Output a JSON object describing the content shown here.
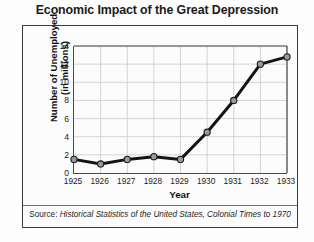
{
  "chart_data": {
    "type": "line",
    "title": "Economic Impact of the Great Depression",
    "xlabel": "Year",
    "ylabel": "Number of Unemployed\n(in millions)",
    "ylabel_line1": "Number of Unemployed",
    "ylabel_line2": "(in millions)",
    "categories": [
      "1925",
      "1926",
      "1927",
      "1928",
      "1929",
      "1930",
      "1931",
      "1932",
      "1933"
    ],
    "values": [
      1.5,
      1.0,
      1.5,
      1.8,
      1.5,
      4.5,
      8.0,
      12.0,
      12.8
    ],
    "x": [
      1925,
      1926,
      1927,
      1928,
      1929,
      1930,
      1931,
      1932,
      1933
    ],
    "xlim": [
      1925,
      1933
    ],
    "ylim": [
      0,
      14
    ],
    "y_ticks": [
      "0",
      "2",
      "4",
      "6",
      "8",
      "10",
      "12",
      "14"
    ],
    "y_tick_values": [
      0,
      2,
      4,
      6,
      8,
      10,
      12,
      14
    ],
    "grid": true,
    "legend": "none",
    "series": [
      {
        "name": "Number of Unemployed (in millions)",
        "values": [
          1.5,
          1.0,
          1.5,
          1.8,
          1.5,
          4.5,
          8.0,
          12.0,
          12.8
        ]
      }
    ],
    "line_color": "#141414",
    "marker_fill": "#9a9a9a",
    "marker_edge": "#1a1a1a",
    "grid_color": "#c9c9c9",
    "axis_color": "#4a4a4a"
  },
  "source": {
    "label": "Source: ",
    "title": "Historical Statistics of the United States, Colonial Times to 1970"
  }
}
